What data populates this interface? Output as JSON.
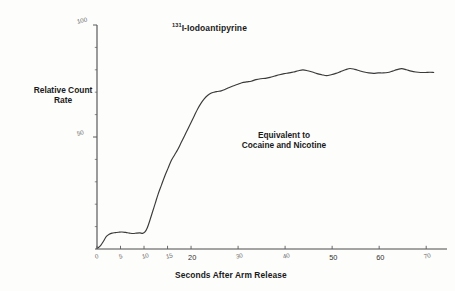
{
  "chart_data": {
    "type": "line",
    "title": "131I-Iodoantipyrine",
    "title_superscript": "131",
    "title_rest": "I-Iodoantipyrine",
    "xlabel": "Seconds After Arm Release",
    "ylabel_lines": [
      "Relative Count",
      "Rate"
    ],
    "xlim": [
      0,
      74
    ],
    "ylim": [
      0,
      100
    ],
    "grid": false,
    "legend": null,
    "xticks": [
      0,
      5,
      10,
      15,
      20,
      30,
      40,
      50,
      60,
      70
    ],
    "xtick_labels": [
      "0",
      "5",
      "10",
      "15",
      "20",
      "30",
      "40",
      "50",
      "60",
      "70"
    ],
    "yticks": [
      50,
      100
    ],
    "ytick_labels": [
      "50",
      "100"
    ],
    "y_minor_tick_step": 10,
    "annotations": [
      {
        "text_lines": [
          "Equivalent to",
          "Cocaine and Nicotine"
        ],
        "x": 45,
        "y": 50
      }
    ],
    "series": [
      {
        "name": "Relative Count Rate",
        "x": [
          0.2,
          0.8,
          1.4,
          2.0,
          2.6,
          3.2,
          3.9,
          4.6,
          5.3,
          6.1,
          6.9,
          7.7,
          8.4,
          9.1,
          9.7,
          10.2,
          10.7,
          11.2,
          11.8,
          12.4,
          13.0,
          13.7,
          14.4,
          15.1,
          15.8,
          16.5,
          17.2,
          17.9,
          18.6,
          19.3,
          20.0,
          20.7,
          21.4,
          22.1,
          22.8,
          23.5,
          24.2,
          24.9,
          25.6,
          26.4,
          27.2,
          28.0,
          28.9,
          29.8,
          30.8,
          31.8,
          32.8,
          33.8,
          34.8,
          35.8,
          36.8,
          37.8,
          38.8,
          39.8,
          40.8,
          41.8,
          42.8,
          43.8,
          44.8,
          45.8,
          46.8,
          47.8,
          48.8,
          49.8,
          50.8,
          51.8,
          52.8,
          53.8,
          54.8,
          55.8,
          56.8,
          57.8,
          58.8,
          59.8,
          60.8,
          61.8,
          62.8,
          63.8,
          64.8,
          65.8,
          66.8,
          67.8,
          68.8,
          69.8,
          70.8,
          71.6
        ],
        "y": [
          0.5,
          1.6,
          3.6,
          5.6,
          6.6,
          7.1,
          7.3,
          7.5,
          7.6,
          7.4,
          7.1,
          6.9,
          7.1,
          7.2,
          7.0,
          7.6,
          9.5,
          12.5,
          16.5,
          20.5,
          24.5,
          28.5,
          32.5,
          36.0,
          39.5,
          42.0,
          44.5,
          47.5,
          50.5,
          53.5,
          56.5,
          59.5,
          62.5,
          65.0,
          67.0,
          68.5,
          69.5,
          70.0,
          70.3,
          70.6,
          71.2,
          72.0,
          72.8,
          73.4,
          74.2,
          74.6,
          74.9,
          75.6,
          76.0,
          76.2,
          76.6,
          77.2,
          77.8,
          78.3,
          78.6,
          79.0,
          79.6,
          80.0,
          79.6,
          79.0,
          78.3,
          77.8,
          77.4,
          77.8,
          78.4,
          79.2,
          80.0,
          80.6,
          80.2,
          79.6,
          79.0,
          78.6,
          78.4,
          78.6,
          78.6,
          78.8,
          79.4,
          80.1,
          80.5,
          80.0,
          79.4,
          79.0,
          78.8,
          78.8,
          78.9,
          78.8
        ]
      }
    ]
  }
}
